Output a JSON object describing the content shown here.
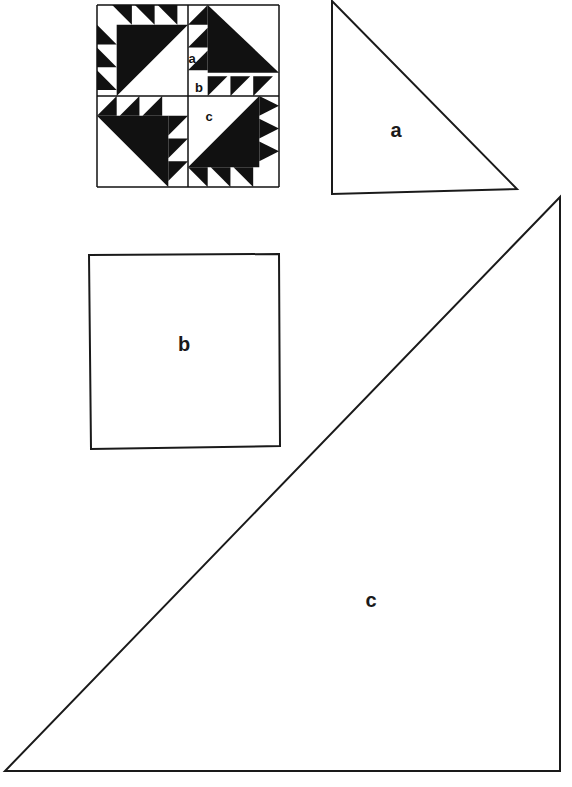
{
  "colors": {
    "ink": "#111111",
    "paper": "#ffffff"
  },
  "block_preview": {
    "x": 97,
    "y": 5,
    "size": 182,
    "labels": [
      {
        "text": "a",
        "x": 192,
        "y": 58
      },
      {
        "text": "b",
        "x": 199,
        "y": 87
      },
      {
        "text": "c",
        "x": 209,
        "y": 116
      }
    ]
  },
  "pieces": [
    {
      "id": "a",
      "shape": "right-triangle",
      "label": "a",
      "points": [
        [
          332,
          1
        ],
        [
          332,
          194
        ],
        [
          517,
          189
        ]
      ],
      "label_pos": [
        396,
        130
      ]
    },
    {
      "id": "b",
      "shape": "square",
      "label": "b",
      "points": [
        [
          89,
          255
        ],
        [
          279,
          254
        ],
        [
          280,
          446
        ],
        [
          91,
          449
        ]
      ],
      "label_pos": [
        184,
        344
      ]
    },
    {
      "id": "c",
      "shape": "right-triangle",
      "label": "c",
      "points": [
        [
          560,
          197
        ],
        [
          560,
          771
        ],
        [
          5,
          771
        ]
      ],
      "label_pos": [
        371,
        600
      ]
    }
  ]
}
